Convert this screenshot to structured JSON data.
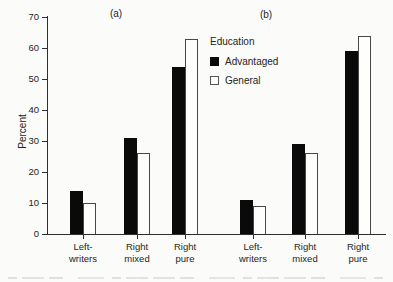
{
  "figure": {
    "panel_a_label": "(a)",
    "panel_b_label": "(b)"
  },
  "legend": {
    "title": "Education",
    "items": [
      {
        "label": "Advantaged",
        "swatch": "filled-black-square"
      },
      {
        "label": "General",
        "swatch": "open-white-square"
      }
    ]
  },
  "chart_data": {
    "type": "bar",
    "title": "",
    "ylabel": "Percent",
    "xlabel": "",
    "ylim": [
      0,
      70
    ],
    "yticks": [
      0,
      10,
      20,
      30,
      40,
      50,
      60,
      70
    ],
    "grid": false,
    "legend_position": "top-center-between-panels",
    "bar_colors": {
      "Advantaged": "#0a0a0a",
      "General": "#ffffff"
    },
    "category_tick_labels": [
      [
        "Left-",
        "writers"
      ],
      [
        "Right",
        "mixed"
      ],
      [
        "Right",
        "pure"
      ]
    ],
    "panels": [
      {
        "label": "(a)",
        "categories": [
          "Left-writers",
          "Right mixed",
          "Right pure"
        ],
        "series": [
          {
            "name": "Advantaged",
            "values": [
              14,
              31,
              54
            ]
          },
          {
            "name": "General",
            "values": [
              10,
              26,
              63
            ]
          }
        ]
      },
      {
        "label": "(b)",
        "categories": [
          "Left-writers",
          "Right mixed",
          "Right pure"
        ],
        "series": [
          {
            "name": "Advantaged",
            "values": [
              11,
              29,
              59
            ]
          },
          {
            "name": "General",
            "values": [
              9,
              26,
              64
            ]
          }
        ]
      }
    ]
  }
}
